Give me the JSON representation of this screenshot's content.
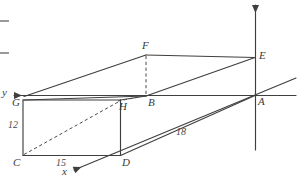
{
  "figure": {
    "kind": "3d-coordinate-box-diagram",
    "stroke_color": "#3f3f3f",
    "dash_color": "#4a4a4a",
    "background": "#ffffff",
    "axes": [
      {
        "name": "x",
        "label": "x",
        "x": 62,
        "y": 166,
        "direction": "down-left",
        "arrow": true
      },
      {
        "name": "y",
        "label": "y",
        "x": 2,
        "y": 87,
        "direction": "left",
        "arrow": true
      },
      {
        "name": "z",
        "label": "",
        "x": 255,
        "y": 3,
        "direction": "up",
        "arrow": true
      }
    ],
    "vertices": [
      {
        "id": "A",
        "label": "A",
        "lx": 258,
        "ly": 96
      },
      {
        "id": "B",
        "label": "B",
        "lx": 148,
        "ly": 97
      },
      {
        "id": "C",
        "label": "C",
        "lx": 13,
        "ly": 157
      },
      {
        "id": "D",
        "label": "D",
        "lx": 122,
        "ly": 157
      },
      {
        "id": "E",
        "label": "E",
        "lx": 259,
        "ly": 50
      },
      {
        "id": "F",
        "label": "F",
        "lx": 142,
        "ly": 40
      },
      {
        "id": "G",
        "label": "G",
        "lx": 12,
        "ly": 97
      },
      {
        "id": "H",
        "label": "H",
        "lx": 119,
        "ly": 101
      }
    ],
    "dimension_labels": [
      {
        "name": "edge-length-12",
        "text": "12",
        "lx": 8,
        "ly": 120
      },
      {
        "name": "edge-length-15",
        "text": "15",
        "lx": 56,
        "ly": 158
      },
      {
        "name": "edge-length-18",
        "text": "18",
        "lx": 176,
        "ly": 127
      }
    ],
    "crop_marks": [
      {
        "x": 0,
        "y": 20
      },
      {
        "x": 0,
        "y": 52
      }
    ]
  }
}
